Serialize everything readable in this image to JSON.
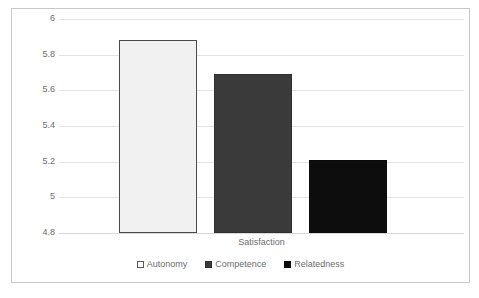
{
  "chart_data": {
    "type": "bar",
    "title": "",
    "subtitle": "",
    "categories": [
      "Satisfaction"
    ],
    "xlabel": "Satisfaction",
    "ylabel": "",
    "ylim": [
      4.8,
      6
    ],
    "ytick_labels": [
      "6",
      "5.8",
      "5.6",
      "5.4",
      "5.2",
      "5",
      "4.8"
    ],
    "ytick_values": [
      6,
      5.8,
      5.6,
      5.4,
      5.2,
      5,
      4.8
    ],
    "grid": true,
    "legend_position": "bottom",
    "series": [
      {
        "name": "Autonomy",
        "values": [
          5.88
        ],
        "color": "#f1f1f1",
        "border_color": "#4a4a4a"
      },
      {
        "name": "Competence",
        "values": [
          5.69
        ],
        "color": "#3a3a3a",
        "border_color": "#2f2f2f"
      },
      {
        "name": "Relatedness",
        "values": [
          5.21
        ],
        "color": "#0d0d0d",
        "border_color": "#0a0a0a"
      }
    ]
  },
  "frame": {
    "border_color": "#c8c8c8",
    "gridline_color": "#e3e3e3",
    "text_color": "#6d6d6d"
  }
}
